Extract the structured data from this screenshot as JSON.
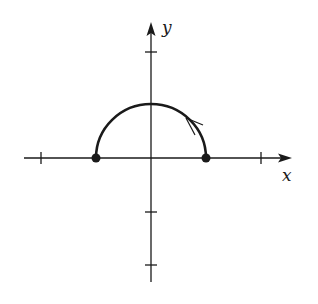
{
  "diagram": {
    "type": "parametric-curve-plot",
    "axes": {
      "x_label": "x",
      "y_label": "y",
      "x_ticks": [
        -2,
        -1,
        1,
        2
      ],
      "y_ticks": [
        2,
        1,
        -1,
        -2
      ],
      "x_range": [
        -2.3,
        2.6
      ],
      "y_range": [
        -2.3,
        2.6
      ]
    },
    "curve": {
      "shape": "upper-semicircle",
      "center": [
        0,
        0
      ],
      "radius": 1,
      "start_point": [
        1,
        0
      ],
      "end_point": [
        -1,
        0
      ],
      "direction": "counterclockwise",
      "direction_arrow_at": "approx (0.7, 0.7)"
    },
    "endpoints": [
      {
        "label": "",
        "x": -1,
        "y": 0,
        "filled": true
      },
      {
        "label": "",
        "x": 1,
        "y": 0,
        "filled": true
      }
    ],
    "colors": {
      "ink": "#1a1a1a",
      "background": "#ffffff"
    }
  }
}
